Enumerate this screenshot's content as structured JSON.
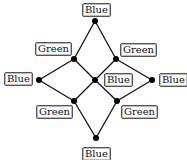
{
  "diagram": {
    "type": "lattice-graph",
    "nodes": [
      {
        "id": "top",
        "x": 95,
        "y": 21,
        "label": "Blue",
        "label_x": 82,
        "label_y": 3
      },
      {
        "id": "ul",
        "x": 74,
        "y": 59,
        "label": "Green",
        "label_x": 35,
        "label_y": 42
      },
      {
        "id": "ur",
        "x": 116,
        "y": 59,
        "label": "Green",
        "label_x": 120,
        "label_y": 43
      },
      {
        "id": "l",
        "x": 39,
        "y": 80,
        "label": "Blue",
        "label_x": 4,
        "label_y": 72
      },
      {
        "id": "c",
        "x": 95,
        "y": 80,
        "label": "Blue",
        "label_x": 104,
        "label_y": 73
      },
      {
        "id": "r",
        "x": 152,
        "y": 80,
        "label": "Blue",
        "label_x": 159,
        "label_y": 73
      },
      {
        "id": "ll",
        "x": 74,
        "y": 101,
        "label": "Green",
        "label_x": 36,
        "label_y": 105
      },
      {
        "id": "lr",
        "x": 117,
        "y": 101,
        "label": "Green",
        "label_x": 121,
        "label_y": 105
      },
      {
        "id": "bot",
        "x": 96,
        "y": 138,
        "label": "Blue",
        "label_x": 82,
        "label_y": 147
      }
    ],
    "edges": [
      [
        "top",
        "ul"
      ],
      [
        "top",
        "ur"
      ],
      [
        "ul",
        "l"
      ],
      [
        "ul",
        "c"
      ],
      [
        "ur",
        "c"
      ],
      [
        "ur",
        "r"
      ],
      [
        "l",
        "ll"
      ],
      [
        "c",
        "ll"
      ],
      [
        "c",
        "lr"
      ],
      [
        "r",
        "lr"
      ],
      [
        "ll",
        "bot"
      ],
      [
        "lr",
        "bot"
      ]
    ],
    "colors": {
      "edge": "#111111",
      "node": "#000000",
      "label_border": "#555555"
    }
  }
}
